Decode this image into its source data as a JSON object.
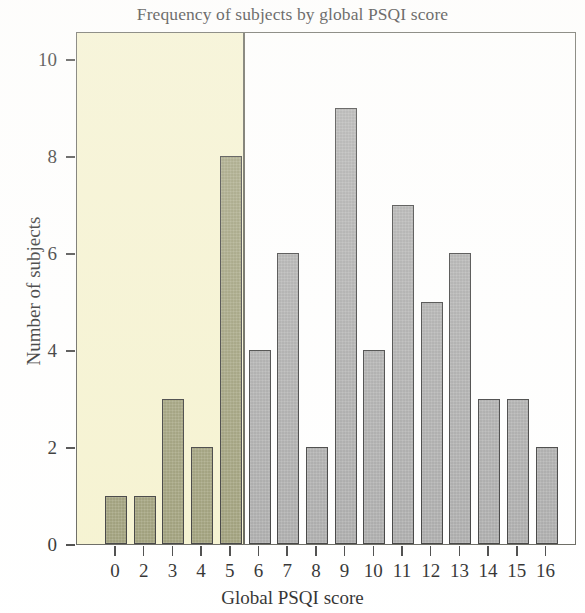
{
  "chart_data": {
    "type": "bar",
    "title": "Frequency of subjects by global PSQI score",
    "xlabel": "Global PSQI score",
    "ylabel": "Number of subjects",
    "categories": [
      "0",
      "2",
      "3",
      "4",
      "5",
      "6",
      "7",
      "8",
      "9",
      "10",
      "11",
      "12",
      "13",
      "14",
      "15",
      "16"
    ],
    "values": [
      1,
      1,
      3,
      2,
      8,
      4,
      6,
      2,
      9,
      4,
      7,
      5,
      6,
      3,
      3,
      2
    ],
    "ylim": [
      0,
      10.5
    ],
    "xtick_labels": [
      "0",
      "2",
      "3",
      "4",
      "5",
      "6",
      "7",
      "8",
      "9",
      "10",
      "11",
      "12",
      "13",
      "14",
      "15",
      "16"
    ],
    "ytick_labels": [
      "0",
      "2",
      "4",
      "6",
      "8",
      "10"
    ],
    "ytick_values": [
      0,
      2,
      4,
      6,
      8,
      10
    ],
    "grid": false,
    "legend": null,
    "bar_colors": [
      "#9a9a70",
      "#9a9a70",
      "#9a9a70",
      "#9a9a70",
      "#9a9a70",
      "#a8a8a8",
      "#a8a8a8",
      "#a8a8a8",
      "#a8a8a8",
      "#a8a8a8",
      "#a8a8a8",
      "#a8a8a8",
      "#a8a8a8",
      "#a8a8a8",
      "#a8a8a8",
      "#a8a8a8"
    ],
    "annotations": [
      {
        "name": "good-sleeper-highlight-band",
        "type": "vertical-span",
        "x_start_category": "0",
        "x_end_category": "5",
        "color": "#f5f2cd",
        "edge_color": "#56564a"
      }
    ],
    "colors": {
      "highlight_band": "#f5f2cd",
      "highlight_bar": "#9a9a70",
      "plain_bar": "#a8a8a8",
      "bar_edge": "#2e2e2e",
      "axis": "#3a3a3a",
      "frame": "#5a5a52",
      "text": "#1c1c1c",
      "background": "#ffffff"
    }
  }
}
